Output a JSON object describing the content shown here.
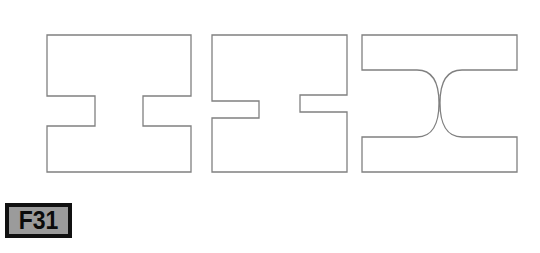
{
  "figure": {
    "label": "F31",
    "label_box": {
      "border_color": "#111111",
      "fill_color": "#9b9b9b",
      "text_color": "#0b0b0b"
    },
    "background_color": "#ffffff",
    "stroke_color": "#808080",
    "fill_color": "#ffffff",
    "caption": ""
  },
  "shapes": [
    {
      "id": "shape-1",
      "name": "square-with-deep-square-notches",
      "description": "Square outline with a wide rectangular notch cut into the left side and a matching rectangular notch cut into the right side, forming a rotated I-beam profile.",
      "notch_style": "square",
      "notch_depth": "deep",
      "bounds": {
        "x": 47,
        "y": 35,
        "width": 144,
        "height": 137
      },
      "path": "M 47 35 L 191 35 L 191 96 L 143 96 L 143 126 L 191 126 L 191 172 L 47 172 L 47 126 L 95 126 L 95 96 L 47 96 Z"
    },
    {
      "id": "shape-2",
      "name": "square-with-narrow-square-notches",
      "description": "Square outline with a narrow shallow rectangular notch cut into the left side and a matching narrow notch cut into the right side.",
      "notch_style": "square",
      "notch_depth": "narrow",
      "bounds": {
        "x": 212,
        "y": 35,
        "width": 135,
        "height": 137
      },
      "path": "M 212 35 L 347 35 L 347 95 L 300 95 L 300 112 L 347 112 L 347 172 L 212 172 L 212 118 L 259 118 L 259 101 L 212 101 Z"
    },
    {
      "id": "shape-3",
      "name": "square-with-rounded-notches",
      "description": "Square outline with semicircular (rounded D-shaped) notches cut into the left and right sides, forming an I-beam profile with curved fillets.",
      "notch_style": "rounded",
      "notch_depth": "deep",
      "bounds": {
        "x": 362,
        "y": 35,
        "width": 155,
        "height": 137
      },
      "path": "M 362 35 L 517 35 L 517 70 L 462 70 C 447 70 440 82 440 103 C 440 124 447 137 462 137 L 517 137 L 517 172 L 362 172 L 362 137 L 417 137 C 432 137 439 124 439 103 C 439 82 432 70 417 70 L 362 70 Z"
    }
  ]
}
